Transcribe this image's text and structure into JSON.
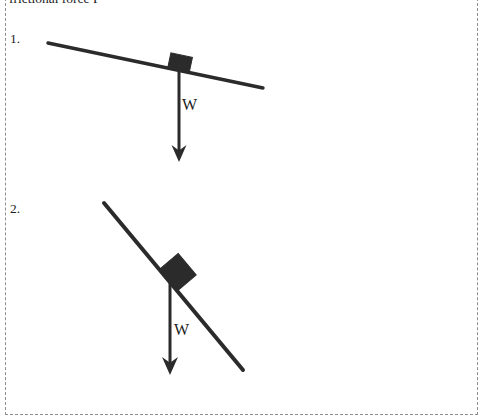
{
  "page": {
    "width": 483,
    "height": 420,
    "background_color": "#ffffff",
    "border_style": "dashed",
    "border_color": "#8d8d8d",
    "ink_color": "#2b2b2b",
    "text_color": "#1d1d1d"
  },
  "header": {
    "clipped_text": "frictional force F"
  },
  "problems": [
    {
      "number_label": "1.",
      "force_label": "W",
      "incline": {
        "x1": 48,
        "y1": 43,
        "x2": 263,
        "y2": 88,
        "angle_deg": 12,
        "stroke_width": 3.4
      },
      "block": {
        "cx": 180,
        "cy": 63,
        "width": 22,
        "height": 16,
        "rotation_deg": 12
      },
      "weight_arrow": {
        "x": 179,
        "y_start": 68,
        "y_end": 162,
        "stroke_width": 3.0,
        "head_width": 15,
        "head_length": 17
      }
    },
    {
      "number_label": "2.",
      "force_label": "W",
      "incline": {
        "x1": 104,
        "y1": 203,
        "x2": 243,
        "y2": 370,
        "angle_deg": 50,
        "stroke_width": 4.0
      },
      "block": {
        "cx": 178,
        "cy": 272,
        "width": 28,
        "height": 24,
        "rotation_deg": 50
      },
      "weight_arrow": {
        "x": 170,
        "y_start": 280,
        "y_end": 375,
        "stroke_width": 3.0,
        "head_width": 16,
        "head_length": 18
      }
    }
  ]
}
